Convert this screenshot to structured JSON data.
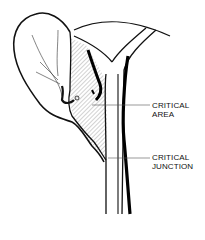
{
  "diagram": {
    "type": "anatomical line drawing",
    "labels": [
      {
        "id": "critical-area",
        "lines": [
          "CRITICAL",
          "AREA"
        ]
      },
      {
        "id": "critical-junction",
        "lines": [
          "CRITICAL",
          "JUNCTION"
        ]
      }
    ],
    "colors": {
      "ink": "#111111",
      "background": "#ffffff",
      "hatch": "#555555"
    }
  }
}
